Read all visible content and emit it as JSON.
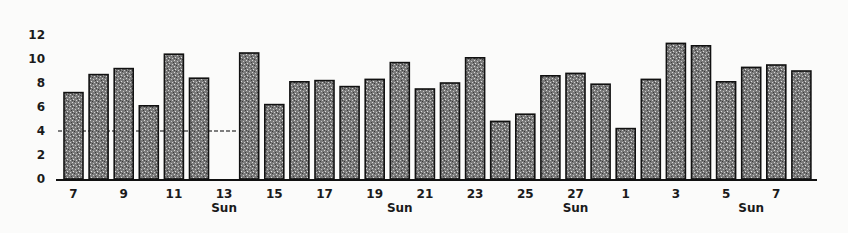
{
  "chart_data": {
    "type": "bar",
    "title": "",
    "xlabel": "",
    "ylabel": "",
    "ylim": [
      0,
      12
    ],
    "yticks": [
      0,
      2,
      4,
      6,
      8,
      10,
      12
    ],
    "grid": false,
    "legend": null,
    "categories": [
      "7",
      "8",
      "9",
      "10",
      "11",
      "12",
      "13",
      "14",
      "15",
      "16",
      "17",
      "18",
      "19",
      "20",
      "21",
      "22",
      "23",
      "24",
      "25",
      "26",
      "27",
      "28",
      "1",
      "2",
      "3",
      "4",
      "5",
      "6",
      "7",
      "8"
    ],
    "values": [
      7.2,
      8.7,
      9.2,
      6.1,
      10.4,
      8.4,
      null,
      10.5,
      6.2,
      8.1,
      8.2,
      7.7,
      8.3,
      9.7,
      7.5,
      8.0,
      10.1,
      4.8,
      5.4,
      8.6,
      8.8,
      7.9,
      4.2,
      8.3,
      11.3,
      11.1,
      8.1,
      9.3,
      9.5,
      9.0
    ],
    "labeled_ticks": [
      {
        "index": 0,
        "label": "7"
      },
      {
        "index": 2,
        "label": "9"
      },
      {
        "index": 4,
        "label": "11"
      },
      {
        "index": 6,
        "label": "13",
        "sub": "Sun"
      },
      {
        "index": 8,
        "label": "15"
      },
      {
        "index": 10,
        "label": "17"
      },
      {
        "index": 12,
        "label": "19"
      },
      {
        "index": 13,
        "label": "",
        "sub": "Sun"
      },
      {
        "index": 14,
        "label": "21"
      },
      {
        "index": 16,
        "label": "23"
      },
      {
        "index": 18,
        "label": "25"
      },
      {
        "index": 20,
        "label": "27",
        "sub": "Sun"
      },
      {
        "index": 22,
        "label": "1"
      },
      {
        "index": 24,
        "label": "3"
      },
      {
        "index": 26,
        "label": "5"
      },
      {
        "index": 27,
        "label": "",
        "sub": "Sun"
      },
      {
        "index": 28,
        "label": "7"
      }
    ],
    "reference_line": {
      "value": 4,
      "style": "dashed",
      "x_from_index": 0,
      "x_to_index": 7
    },
    "colors": {
      "bar_fill": "#8a8a8a",
      "bar_edge": "#111111",
      "axis": "#111111",
      "background": "#fbfbfa"
    }
  }
}
